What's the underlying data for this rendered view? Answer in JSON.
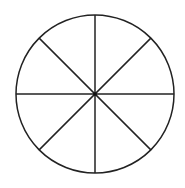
{
  "diagram": {
    "type": "divided-circle",
    "sectors": 8,
    "center": {
      "x": 95,
      "y": 94
    },
    "radius": 79,
    "stroke_color": "#222222",
    "fill_color": "#ffffff",
    "stroke_width": 1.5,
    "center_dot": true
  }
}
